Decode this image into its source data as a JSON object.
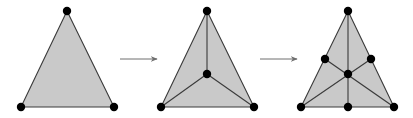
{
  "diagram": {
    "colors": {
      "fill": "#c9c9c9",
      "stroke": "#3a3a3a",
      "vertex": "#000000",
      "arrow": "#6e6e6e",
      "background": "#ffffff"
    },
    "vertex_radius": 4.2,
    "stages": [
      {
        "name": "original-triangle",
        "outline": [
          [
            67,
            11
          ],
          [
            21,
            107
          ],
          [
            114,
            107
          ]
        ],
        "inner_edges": [],
        "vertices": [
          [
            67,
            11
          ],
          [
            21,
            107
          ],
          [
            114,
            107
          ]
        ]
      },
      {
        "name": "centroid-subdivision",
        "outline": [
          [
            207,
            11
          ],
          [
            161,
            107
          ],
          [
            254,
            107
          ]
        ],
        "inner_edges": [
          [
            [
              207,
              11
            ],
            [
              207,
              74
            ]
          ],
          [
            [
              161,
              107
            ],
            [
              207,
              74
            ]
          ],
          [
            [
              254,
              107
            ],
            [
              207,
              74
            ]
          ]
        ],
        "vertices": [
          [
            207,
            11
          ],
          [
            161,
            107
          ],
          [
            254,
            107
          ],
          [
            207,
            74
          ]
        ]
      },
      {
        "name": "midpoint-subdivision",
        "outline": [
          [
            348,
            11
          ],
          [
            301,
            107
          ],
          [
            394,
            107
          ]
        ],
        "inner_edges": [
          [
            [
              348,
              11
            ],
            [
              348,
              107
            ]
          ],
          [
            [
              301,
              107
            ],
            [
              371,
              59
            ]
          ],
          [
            [
              394,
              107
            ],
            [
              325,
              59
            ]
          ]
        ],
        "vertices": [
          [
            348,
            11
          ],
          [
            301,
            107
          ],
          [
            394,
            107
          ],
          [
            348,
            74
          ],
          [
            325,
            59
          ],
          [
            371,
            59
          ],
          [
            348,
            107
          ]
        ]
      }
    ],
    "arrows": [
      {
        "name": "arrow-stage-1-to-2",
        "from": [
          120,
          59
        ],
        "to": [
          157,
          59
        ]
      },
      {
        "name": "arrow-stage-2-to-3",
        "from": [
          260,
          59
        ],
        "to": [
          297,
          59
        ]
      }
    ]
  }
}
